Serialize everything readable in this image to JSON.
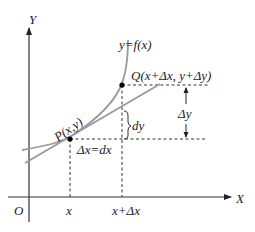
{
  "diagram": {
    "axes": {
      "x_label": "X",
      "y_label": "Y",
      "origin_label": "O"
    },
    "curve_label": "y=f(x)",
    "point_p_label": "P(x,y)",
    "point_q_label": "Q(x+Δx, y+Δy)",
    "tick_x": "x",
    "tick_x_dx": "x+Δx",
    "dx_label": "Δx=dx",
    "dy_label": "dy",
    "delta_y_label": "Δy",
    "colors": {
      "curve": "#9a9a9a",
      "tangent": "#9a9a9a",
      "axes": "#333333",
      "dashed": "#333333",
      "point": "#000000"
    }
  }
}
